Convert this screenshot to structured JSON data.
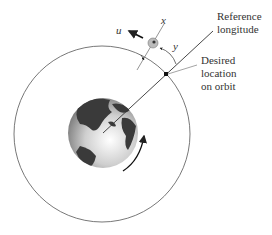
{
  "labels": {
    "reference_longitude": [
      "Reference",
      "longitude"
    ],
    "desired_location": [
      "Desired",
      "location",
      "on orbit"
    ]
  },
  "variables": {
    "u": "u",
    "x": "x",
    "y": "y"
  },
  "colors": {
    "line": "#333333",
    "orbit": "#555555",
    "ocean_light": "#f0f0f0",
    "ocean_dark": "#8a8a8a",
    "land": "#3a3a3a"
  }
}
